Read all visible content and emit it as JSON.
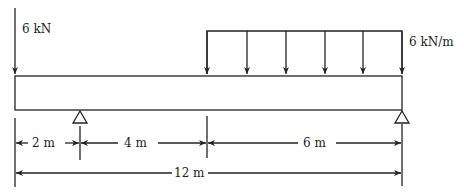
{
  "diagram": {
    "type": "beam-loading",
    "beam": {
      "length_m": 12
    },
    "loads": {
      "point_load": {
        "label": "6 kN",
        "position_m": 0
      },
      "distributed_load": {
        "label": "6 kN/m",
        "start_m": 6,
        "end_m": 12
      }
    },
    "supports": [
      {
        "type": "pin",
        "position_m": 2
      },
      {
        "type": "pin",
        "position_m": 12
      }
    ],
    "dimensions": [
      {
        "label": "2 m"
      },
      {
        "label": "4 m"
      },
      {
        "label": "6 m"
      },
      {
        "label": "12 m"
      }
    ],
    "colors": {
      "line": "#222222",
      "background": "#ffffff"
    }
  }
}
